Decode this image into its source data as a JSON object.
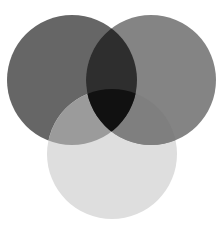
{
  "diagram": {
    "type": "venn",
    "sets": [
      {
        "id": "left",
        "cx": 72,
        "cy": 80,
        "r": 65,
        "color": "#666666"
      },
      {
        "id": "right",
        "cx": 151,
        "cy": 80,
        "r": 65,
        "color": "#848484"
      },
      {
        "id": "bottom",
        "cx": 112,
        "cy": 154,
        "r": 65,
        "color": "#dedede"
      }
    ],
    "overlaps": {
      "left_right": "#2e2e2e",
      "left_bottom": "#9b9b9b",
      "right_bottom": "#7f7f7f",
      "all_three": "#111111"
    },
    "background": "#ffffff"
  }
}
